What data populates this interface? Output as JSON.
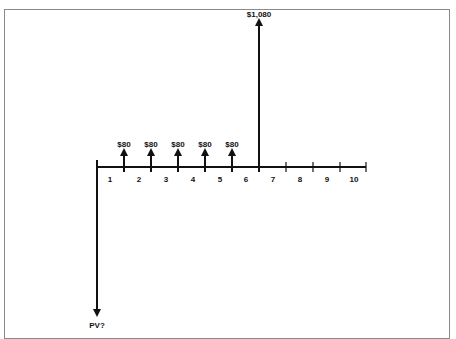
{
  "diagram": {
    "type": "cash-flow-timeline",
    "colors": {
      "line": "#111111",
      "frame": "#8a8a8a",
      "background": "#ffffff"
    },
    "periods": [
      "1",
      "2",
      "3",
      "4",
      "5",
      "6",
      "7",
      "8",
      "9",
      "10"
    ],
    "inflows": [
      {
        "label": "$80",
        "after_period": 1
      },
      {
        "label": "$80",
        "after_period": 2
      },
      {
        "label": "$80",
        "after_period": 3
      },
      {
        "label": "$80",
        "after_period": 4
      },
      {
        "label": "$80",
        "after_period": 5
      },
      {
        "label": "$1,080",
        "after_period": 6
      }
    ],
    "outflow": {
      "label": "PV?",
      "at_period": 0
    }
  }
}
